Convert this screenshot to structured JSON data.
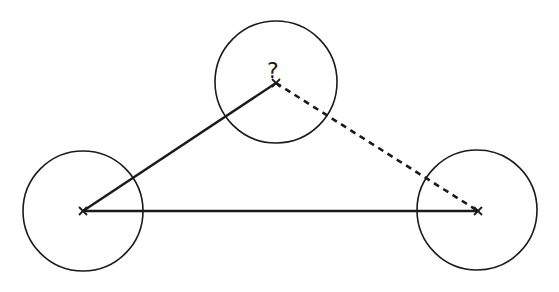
{
  "diagram": {
    "title": "",
    "stroke_color": "#1a1a1a",
    "background": "#ffffff",
    "nodes": [
      {
        "id": "left",
        "cx": 83,
        "cy": 211,
        "r": 60,
        "marker": "x",
        "label": ""
      },
      {
        "id": "top",
        "cx": 276,
        "cy": 82,
        "r": 61,
        "marker": "x",
        "label": "?"
      },
      {
        "id": "right",
        "cx": 477,
        "cy": 210,
        "r": 60,
        "marker": "x",
        "label": ""
      }
    ],
    "edges": [
      {
        "from": "left",
        "to": "top",
        "style": "solid"
      },
      {
        "from": "left",
        "to": "right",
        "style": "solid"
      },
      {
        "from": "top",
        "to": "right",
        "style": "dashed"
      }
    ],
    "unknown_label": "?"
  }
}
